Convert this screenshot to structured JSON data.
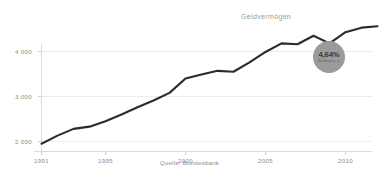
{
  "chart_data": {
    "type": "line",
    "title": "",
    "series_label": "Geldvermögen",
    "source": "Quelle: Bundesbank",
    "xlabel": "",
    "ylabel": "",
    "xlim": [
      1991,
      2012
    ],
    "ylim": [
      1700,
      4950
    ],
    "grid": true,
    "legend_position": "inline-right",
    "x": [
      1991,
      1992,
      1993,
      1994,
      1995,
      1996,
      1997,
      1998,
      1999,
      2000,
      2001,
      2002,
      2003,
      2004,
      2005,
      2006,
      2007,
      2008,
      2009,
      2010,
      2011,
      2012
    ],
    "values": [
      1950,
      2130,
      2280,
      2330,
      2450,
      2600,
      2760,
      2910,
      3080,
      3400,
      3490,
      3570,
      3550,
      3760,
      3990,
      4180,
      4160,
      4350,
      4180,
      4430,
      4530,
      4560
    ],
    "series": [
      {
        "name": "Geldvermögen",
        "values": [
          1950,
          2130,
          2280,
          2330,
          2450,
          2600,
          2760,
          2910,
          3080,
          3400,
          3490,
          3570,
          3550,
          3760,
          3990,
          4180,
          4160,
          4350,
          4180,
          4430,
          4530,
          4560
        ],
        "color": "#2b2b2b"
      }
    ],
    "y_ticks": [
      2000,
      3000,
      4000
    ],
    "y_tick_labels": [
      "2 000",
      "3 000",
      "4 000"
    ],
    "x_ticks": [
      1991,
      1995,
      2000,
      2005,
      2010
    ],
    "x_tick_labels": [
      "1991",
      "1995",
      "2000",
      "2005",
      "2010"
    ],
    "annotation": {
      "value": "4,64%",
      "caption": "Wachstum p. a.",
      "shape": "circle",
      "color": "#9b9b9b"
    }
  },
  "colors": {
    "background": "#ffffff",
    "line": "#2b2b2b",
    "grid": "#ececed",
    "axis": "#d8d8d8",
    "tick_text": "#8d8d8d",
    "badge_fill": "#9b9b9b"
  }
}
